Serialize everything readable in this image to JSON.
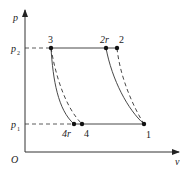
{
  "diagram": {
    "type": "p-v diagram",
    "axes": {
      "y_label": "p",
      "x_label": "v",
      "origin_label": "O"
    },
    "pressure_levels": [
      {
        "label": "p",
        "subscript": "2"
      },
      {
        "label": "p",
        "subscript": "1"
      }
    ],
    "points": [
      {
        "id": "3",
        "label": "3"
      },
      {
        "id": "2r",
        "label": "2r"
      },
      {
        "id": "2",
        "label": "2"
      },
      {
        "id": "4r",
        "label": "4r"
      },
      {
        "id": "4",
        "label": "4"
      },
      {
        "id": "1",
        "label": "1"
      }
    ],
    "colors": {
      "line": "#333333",
      "background": "#ffffff"
    }
  }
}
